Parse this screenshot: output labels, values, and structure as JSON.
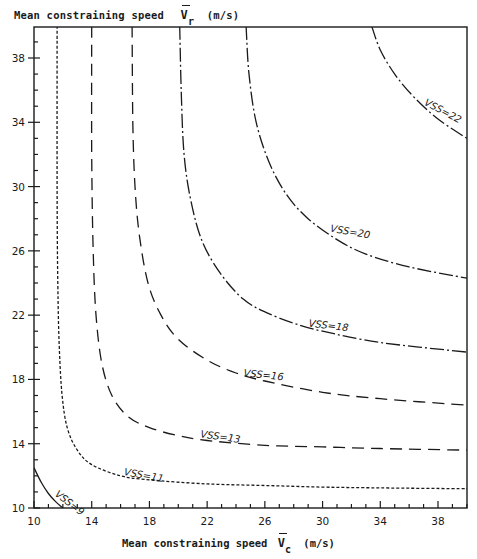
{
  "chart_data": {
    "type": "line",
    "title": "",
    "xlabel": "Mean constraining speed V̄c (m/s)",
    "ylabel": "Mean constraining speed V̄r (m/s)",
    "xlim": [
      10,
      40
    ],
    "ylim": [
      10,
      40
    ],
    "xticks_major": [
      10,
      14,
      18,
      22,
      26,
      30,
      34,
      38
    ],
    "yticks_major": [
      10,
      14,
      18,
      22,
      26,
      30,
      34,
      38
    ],
    "minor_tick_step": 1,
    "grid": false,
    "legend": "inline curve labels",
    "series": [
      {
        "name": "VSS=9",
        "label": "VSS=9",
        "style": "solid",
        "points": [
          [
            10,
            12.5
          ],
          [
            10.5,
            11.6
          ],
          [
            11.0,
            10.9
          ],
          [
            11.5,
            10.4
          ],
          [
            12.0,
            10.0
          ]
        ],
        "label_at": [
          11.4,
          10.8
        ],
        "label_angle": 38
      },
      {
        "name": "VSS=11",
        "label": "VSS=11",
        "style": "short-dash",
        "points": [
          [
            11.6,
            40
          ],
          [
            11.6,
            30
          ],
          [
            11.65,
            24
          ],
          [
            11.75,
            20
          ],
          [
            11.95,
            17
          ],
          [
            12.3,
            15
          ],
          [
            13,
            13.6
          ],
          [
            14,
            12.7
          ],
          [
            16,
            12.0
          ],
          [
            18,
            11.75
          ],
          [
            22,
            11.5
          ],
          [
            26,
            11.4
          ],
          [
            30,
            11.3
          ],
          [
            34,
            11.25
          ],
          [
            40,
            11.2
          ]
        ],
        "label_at": [
          16.2,
          12.05
        ],
        "label_angle": 10
      },
      {
        "name": "VSS=13",
        "label": "VSS=13",
        "style": "long-dash",
        "points": [
          [
            14.0,
            40
          ],
          [
            14.0,
            32
          ],
          [
            14.1,
            26
          ],
          [
            14.3,
            22
          ],
          [
            14.7,
            19
          ],
          [
            15.4,
            17
          ],
          [
            16.5,
            15.7
          ],
          [
            18,
            15.0
          ],
          [
            20,
            14.5
          ],
          [
            22,
            14.2
          ],
          [
            26,
            13.9
          ],
          [
            30,
            13.8
          ],
          [
            34,
            13.7
          ],
          [
            40,
            13.6
          ]
        ],
        "label_at": [
          21.5,
          14.4
        ],
        "label_angle": 8
      },
      {
        "name": "VSS=16",
        "label": "VSS=16",
        "style": "long-dash",
        "points": [
          [
            16.8,
            40
          ],
          [
            16.85,
            34
          ],
          [
            17.0,
            30
          ],
          [
            17.3,
            27
          ],
          [
            17.9,
            24
          ],
          [
            18.8,
            22
          ],
          [
            20,
            20.5
          ],
          [
            22,
            19.2
          ],
          [
            24,
            18.4
          ],
          [
            26,
            17.9
          ],
          [
            30,
            17.2
          ],
          [
            34,
            16.8
          ],
          [
            40,
            16.4
          ]
        ],
        "label_at": [
          24.5,
          18.2
        ],
        "label_angle": 6
      },
      {
        "name": "VSS=18",
        "label": "VSS=18",
        "style": "dash-dot",
        "points": [
          [
            20.1,
            40
          ],
          [
            20.2,
            36
          ],
          [
            20.4,
            32
          ],
          [
            20.9,
            29
          ],
          [
            21.7,
            26.5
          ],
          [
            23,
            24.5
          ],
          [
            24.5,
            23
          ],
          [
            26,
            22.2
          ],
          [
            28,
            21.5
          ],
          [
            30,
            21.0
          ],
          [
            34,
            20.3
          ],
          [
            40,
            19.7
          ]
        ],
        "label_at": [
          29.0,
          21.3
        ],
        "label_angle": 7
      },
      {
        "name": "VSS=20",
        "label": "VSS=20",
        "style": "dash-dot",
        "points": [
          [
            24.7,
            40
          ],
          [
            24.9,
            37
          ],
          [
            25.4,
            34
          ],
          [
            26.3,
            31.5
          ],
          [
            27.5,
            29.5
          ],
          [
            29,
            28
          ],
          [
            31,
            26.7
          ],
          [
            33,
            25.8
          ],
          [
            36,
            25.0
          ],
          [
            40,
            24.3
          ]
        ],
        "label_at": [
          30.5,
          27.2
        ],
        "label_angle": 10
      },
      {
        "name": "VSS=22",
        "label": "VSS=22",
        "style": "dash-dot",
        "points": [
          [
            33.4,
            40
          ],
          [
            34.0,
            38.5
          ],
          [
            35,
            37
          ],
          [
            36.3,
            35.6
          ],
          [
            38,
            34.2
          ],
          [
            40,
            33.0
          ]
        ],
        "label_at": [
          37.0,
          35.1
        ],
        "label_angle": 28
      }
    ]
  },
  "axes": {
    "x_label_text": "Mean constraining speed",
    "x_symbol": "V",
    "x_sub": "c",
    "x_unit": "(m/s)",
    "y_label_text": "Mean constraining  speed",
    "y_symbol": "V",
    "y_sub": "r",
    "y_unit": "(m/s)"
  }
}
